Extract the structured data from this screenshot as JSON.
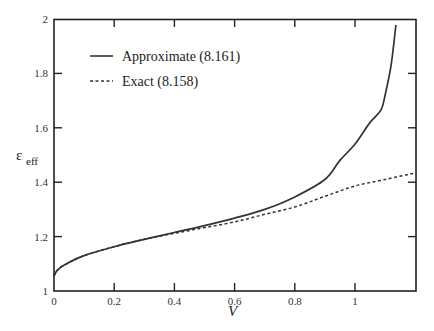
{
  "chart_data": {
    "type": "line",
    "title": "",
    "xlabel": "V",
    "ylabel": "ε_eff",
    "ylabel_main": "ε",
    "ylabel_sub": "eff",
    "xlim": [
      0,
      1.2
    ],
    "ylim": [
      1,
      2
    ],
    "xticks": [
      0,
      0.2,
      0.4,
      0.6,
      0.8,
      1
    ],
    "xtick_labels": [
      "0",
      "0.2",
      "0.4",
      "0.6",
      "0.8",
      "1"
    ],
    "yticks": [
      1,
      1.2,
      1.4,
      1.6,
      1.8,
      2
    ],
    "ytick_labels": [
      "1",
      "1.2",
      "1.4",
      "1.6",
      "1.8",
      "2"
    ],
    "grid": false,
    "legend_position": "upper-left",
    "series": [
      {
        "name": "Approximate (8.161)",
        "style": "solid",
        "x": [
          0,
          0.01,
          0.033,
          0.1,
          0.2,
          0.3,
          0.4,
          0.5,
          0.6,
          0.7,
          0.8,
          0.9,
          0.95,
          1.0,
          1.05,
          1.086,
          1.1,
          1.12,
          1.136
        ],
        "y": [
          1.055,
          1.075,
          1.095,
          1.13,
          1.163,
          1.19,
          1.215,
          1.24,
          1.268,
          1.3,
          1.346,
          1.41,
          1.48,
          1.54,
          1.62,
          1.665,
          1.72,
          1.83,
          1.978
        ]
      },
      {
        "name": "Exact (8.158)",
        "style": "dashed",
        "x": [
          0,
          0.01,
          0.033,
          0.1,
          0.2,
          0.3,
          0.4,
          0.5,
          0.6,
          0.7,
          0.8,
          0.9,
          1.0,
          1.1,
          1.2
        ],
        "y": [
          1.055,
          1.075,
          1.095,
          1.13,
          1.163,
          1.19,
          1.212,
          1.233,
          1.254,
          1.282,
          1.309,
          1.348,
          1.386,
          1.41,
          1.434
        ]
      }
    ]
  },
  "legend": {
    "items": [
      {
        "label": "Approximate (8.161)",
        "style": "solid"
      },
      {
        "label": "Exact (8.158)",
        "style": "dashed"
      }
    ]
  },
  "colors": {
    "line": "#333333",
    "axis": "#222222"
  }
}
